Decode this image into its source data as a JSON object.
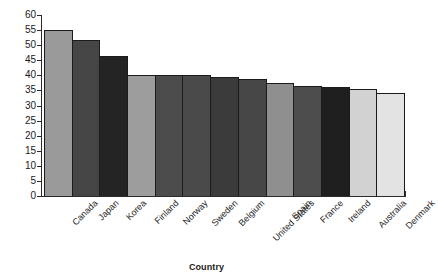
{
  "chart_data": {
    "type": "bar",
    "title": "",
    "subtitle": "",
    "xlabel": "Country",
    "ylabel": "Percentage",
    "categories": [
      "Canada",
      "Japan",
      "Korea",
      "Finland",
      "Norway",
      "Sweden",
      "Belgium",
      "United States",
      "Spain",
      "France",
      "Ireland",
      "Australia",
      "Denmark"
    ],
    "values": [
      55,
      51.8,
      46.5,
      40,
      40,
      40,
      39.3,
      38.7,
      37.5,
      36.5,
      36.3,
      35.5,
      34.3
    ],
    "ylim": [
      0,
      60
    ],
    "ytick_step": 5,
    "ytick_labels": [
      "60",
      "55",
      "50",
      "45",
      "40",
      "35",
      "30",
      "25",
      "20",
      "15",
      "10",
      "5",
      "0"
    ],
    "grid": false,
    "legend": "none",
    "bar_colors": [
      "#9a9a9a",
      "#454545",
      "#242424",
      "#9d9d9d",
      "#4c4c4c",
      "#4a4a4a",
      "#3b3b3b",
      "#474747",
      "#8f8f8f",
      "#4d4d4d",
      "#1f1f1f",
      "#d2d2d2",
      "#e3e3e3"
    ],
    "bar_border_color": "#1b1b1b",
    "axis_color": "#2b2b2b",
    "background_color": "#ffffff",
    "text_color": "#1a1a1a"
  }
}
